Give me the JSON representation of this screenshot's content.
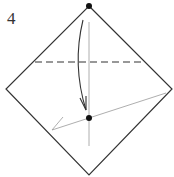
{
  "diagram": {
    "step_number": "4",
    "type": "origami-fold",
    "colors": {
      "outline": "#333333",
      "guide": "#999999",
      "dot": "#111111"
    }
  }
}
